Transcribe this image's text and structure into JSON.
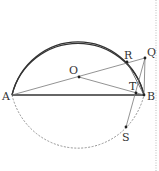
{
  "diagram": {
    "points": {
      "A": {
        "label": "A",
        "x": 12,
        "y": 95
      },
      "B": {
        "label": "B",
        "x": 144,
        "y": 95
      },
      "O": {
        "label": "O",
        "x": 79,
        "y": 77
      },
      "Q": {
        "label": "Q",
        "x": 145,
        "y": 58
      },
      "R": {
        "label": "R",
        "x": 127,
        "y": 62
      },
      "T": {
        "label": "T",
        "x": 136,
        "y": 93
      },
      "S": {
        "label": "S",
        "x": 126,
        "y": 127
      }
    },
    "colors": {
      "stroke": "#333333",
      "thin": "#777777",
      "dashed": "#888888",
      "border": "#bbbbbb"
    }
  }
}
